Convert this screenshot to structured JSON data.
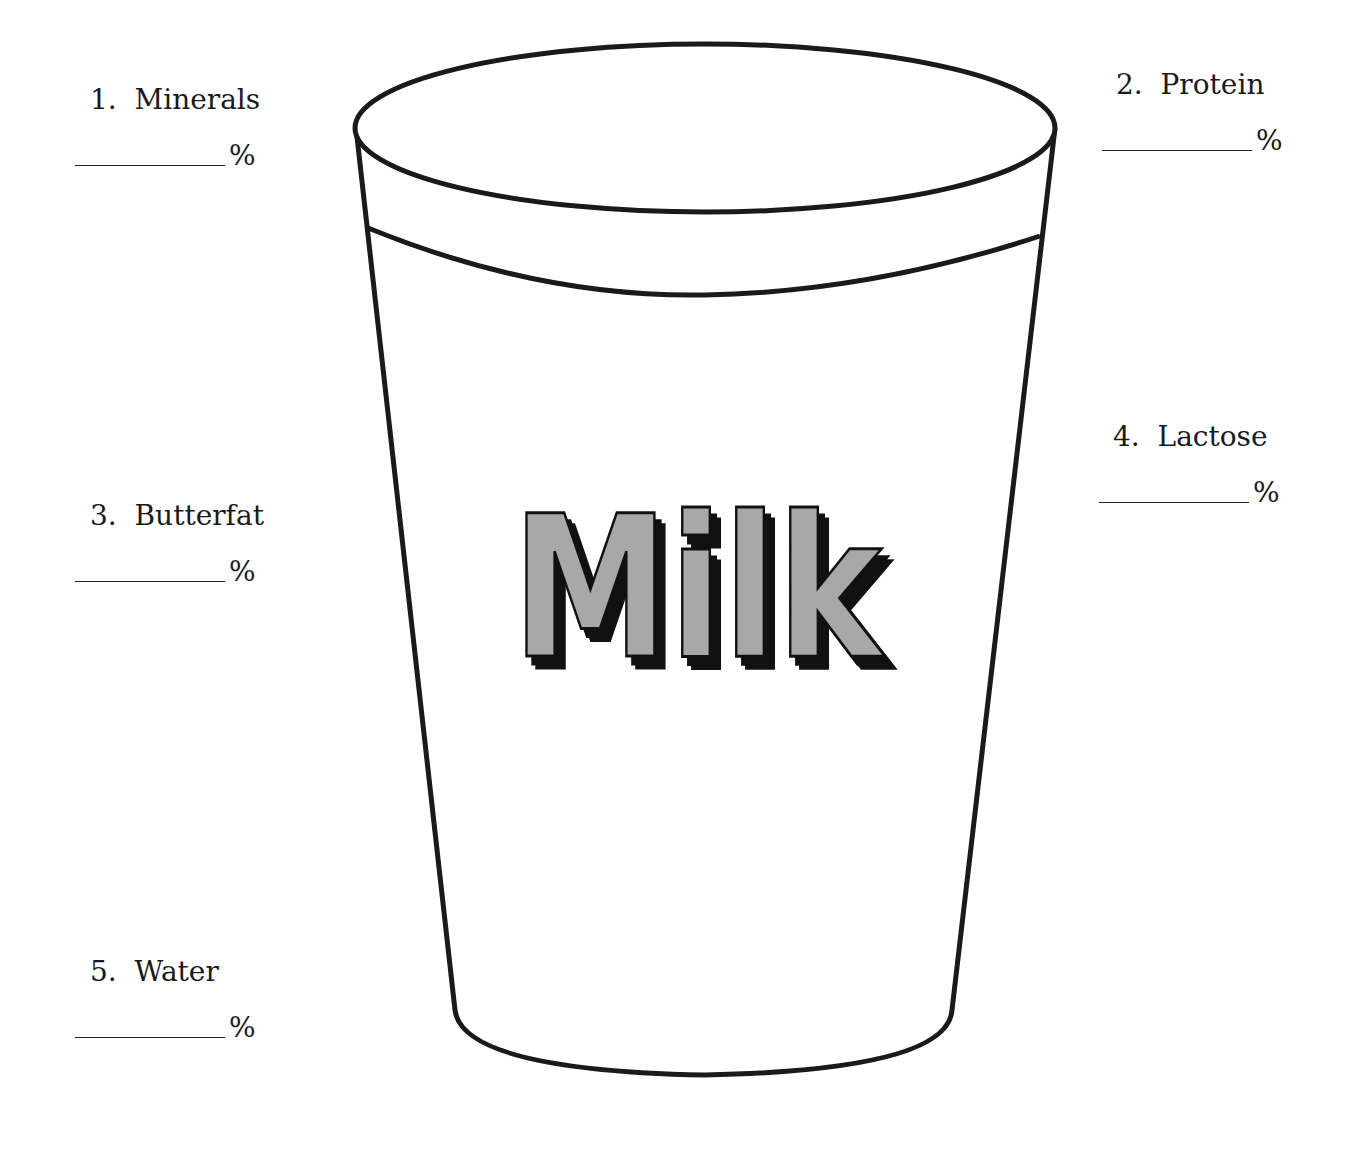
{
  "worksheet": {
    "glass_label": "Milk",
    "components": [
      {
        "number": "1.",
        "name": "Minerals",
        "unit": "%",
        "answer": ""
      },
      {
        "number": "2.",
        "name": "Protein",
        "unit": "%",
        "answer": ""
      },
      {
        "number": "3.",
        "name": "Butterfat",
        "unit": "%",
        "answer": ""
      },
      {
        "number": "4.",
        "name": "Lactose",
        "unit": "%",
        "answer": ""
      },
      {
        "number": "5.",
        "name": "Water",
        "unit": "%",
        "answer": ""
      }
    ],
    "colors": {
      "outline": "#1a1a1a",
      "letter_fill": "#a8a8a8",
      "letter_shadow": "#111111"
    }
  }
}
